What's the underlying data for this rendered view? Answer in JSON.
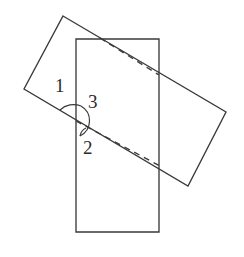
{
  "figure": {
    "background_color": "#ffffff",
    "stroke_color": "#3a3a3a",
    "label_color": "#2b2b2b",
    "width": 244,
    "height": 257,
    "labels": [
      {
        "id": "angle-1",
        "text": "1",
        "x": 55,
        "y": 76
      },
      {
        "id": "angle-3",
        "text": "3",
        "x": 88,
        "y": 92
      },
      {
        "id": "angle-2",
        "text": "2",
        "x": 83,
        "y": 138
      }
    ],
    "shapes": {
      "vertical_rectangle": {
        "name": "upright-rectangle",
        "points": "76,39 159,39 159,232 76,232",
        "x": 76,
        "y": 39,
        "width": 83,
        "height": 193
      },
      "tilted_rectangle": {
        "name": "rotated-rectangle",
        "points": "63,16 226,112 188,186 24,89"
      },
      "diagonal_dashed_upper": {
        "name": "dashed-diagonal-upper",
        "from_x": 100,
        "from_y": 38,
        "to_x": 159,
        "to_y": 75
      },
      "diagonal_dashed_lower": {
        "name": "dashed-diagonal-lower",
        "from_x": 76,
        "from_y": 121,
        "to_x": 160,
        "to_y": 166
      }
    },
    "angle_marks": {
      "upper_arc": {
        "name": "angle-1-arc",
        "path": "M 60 110 A 20 20 0 0 1 81 106"
      },
      "right_arc": {
        "name": "angle-3-arc",
        "path": "M 81 106 A 17 17 0 0 1 80 136"
      },
      "lower_arc": {
        "name": "angle-2-arc",
        "path": "M 80 136 A 11 11 0 0 1 86 128"
      }
    }
  }
}
